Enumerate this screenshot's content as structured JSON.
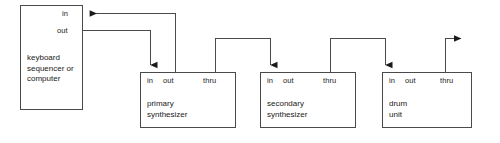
{
  "diagram": {
    "stroke_color": "#4a4a4a",
    "text_color": "#1a1a1a",
    "background": "#ffffff",
    "nodes": [
      {
        "id": "keyboard",
        "label": "keyboard\nsequencer or\ncomputer",
        "ports": [
          {
            "id": "in",
            "label": "in"
          },
          {
            "id": "out",
            "label": "out"
          }
        ]
      },
      {
        "id": "primary-synth",
        "label": "primary\nsynthesizer",
        "ports": [
          {
            "id": "in",
            "label": "in"
          },
          {
            "id": "out",
            "label": "out"
          },
          {
            "id": "thru",
            "label": "thru"
          }
        ]
      },
      {
        "id": "secondary-synth",
        "label": "secondary\nsynthesizer",
        "ports": [
          {
            "id": "in",
            "label": "in"
          },
          {
            "id": "out",
            "label": "out"
          },
          {
            "id": "thru",
            "label": "thru"
          }
        ]
      },
      {
        "id": "drum-unit",
        "label": "drum\nunit",
        "ports": [
          {
            "id": "in",
            "label": "in"
          },
          {
            "id": "out",
            "label": "out"
          },
          {
            "id": "thru",
            "label": "thru"
          }
        ]
      }
    ],
    "connections": [
      {
        "id": "keyboard-out-to-primary-in",
        "from": "keyboard.out",
        "to": "primary-synth.in"
      },
      {
        "id": "primary-out-to-keyboard-in",
        "from": "primary-synth.out",
        "to": "keyboard.in"
      },
      {
        "id": "primary-thru-to-secondary-in",
        "from": "primary-synth.thru",
        "to": "secondary-synth.in"
      },
      {
        "id": "secondary-thru-to-drum-in",
        "from": "secondary-synth.thru",
        "to": "drum-unit.in"
      },
      {
        "id": "drum-thru-to-next",
        "from": "drum-unit.thru",
        "to": ""
      }
    ]
  }
}
